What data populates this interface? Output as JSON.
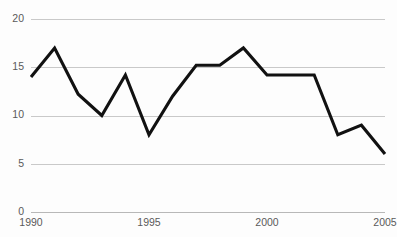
{
  "chart_data": {
    "type": "line",
    "title": "",
    "subtitle": "",
    "xlabel": "",
    "ylabel": "",
    "x": [
      1990,
      1991,
      1992,
      1993,
      1994,
      1995,
      1996,
      1997,
      1998,
      1999,
      2000,
      2001,
      2002,
      2003,
      2004,
      2005
    ],
    "values": [
      14,
      17,
      12.2,
      10,
      14.2,
      8,
      12,
      15.2,
      15.2,
      17,
      14.2,
      14.2,
      14.2,
      8,
      9,
      6
    ],
    "series": [
      {
        "name": "series-1",
        "color": "#111111",
        "values": [
          14,
          17,
          12.2,
          10,
          14.2,
          8,
          12,
          15.2,
          15.2,
          17,
          14.2,
          14.2,
          14.2,
          8,
          9,
          6
        ]
      }
    ],
    "xlim": [
      1990,
      2005
    ],
    "ylim": [
      0,
      20
    ],
    "y_ticks": [
      0,
      5,
      10,
      15,
      20
    ],
    "y_tick_labels": [
      "0",
      "5",
      "10",
      "15",
      "20"
    ],
    "x_ticks": [
      1990,
      1995,
      2000,
      2005
    ],
    "x_tick_labels": [
      "1990",
      "1995",
      "2000",
      "2005"
    ],
    "grid": true,
    "grid_axis": "y",
    "legend": false,
    "legend_position": "none",
    "annotations": [],
    "colors": {
      "background": "#fdfdfd",
      "line": "#111111",
      "gridline": "#c9c9c9",
      "axis": "#b8b8b8",
      "tick_text": "#5a5a5a"
    }
  }
}
